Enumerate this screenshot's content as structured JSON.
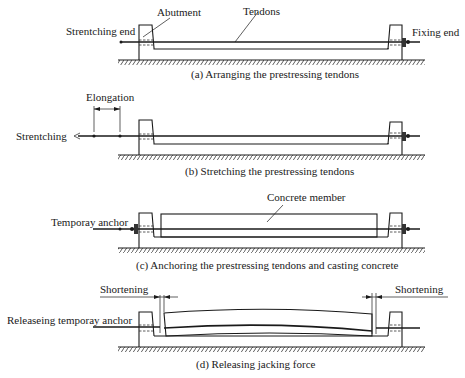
{
  "figure": {
    "panels": [
      {
        "id": "a",
        "caption": "(a) Arranging the prestressing tendons",
        "labels": {
          "left_end": "Strentching end",
          "abutment": "Abutment",
          "tendons": "Tendons",
          "right_end": "Fixing end"
        }
      },
      {
        "id": "b",
        "caption": "(b) Stretching the prestressing tendons",
        "labels": {
          "elongation": "Elongation",
          "stretching": "Strentching"
        }
      },
      {
        "id": "c",
        "caption": "(c)  Anchoring the prestressing tendons  and casting concrete",
        "labels": {
          "temporary_anchor": "Temporay anchor",
          "concrete_member": "Concrete member"
        }
      },
      {
        "id": "d",
        "caption": "(d) Releasing jacking force",
        "labels": {
          "shortening_left": "Shortening",
          "shortening_right": "Shortening",
          "release": "Releaseing temporay anchor"
        }
      }
    ]
  },
  "colors": {
    "ink": "#1a1a1a",
    "background": "#ffffff"
  }
}
